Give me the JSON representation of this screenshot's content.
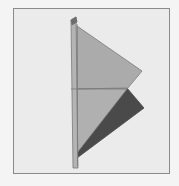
{
  "figure": {
    "colors": {
      "background": "#ebebeb",
      "frame_border": "#8a8a8a",
      "plate": "#b4b4b4",
      "plate_edge": "#6e6e6e",
      "upper_face": "#ababab",
      "lower_face": "#b0b0b0",
      "dark_face": "#4a4a4a",
      "edge_line": "#7a7a7a"
    }
  }
}
